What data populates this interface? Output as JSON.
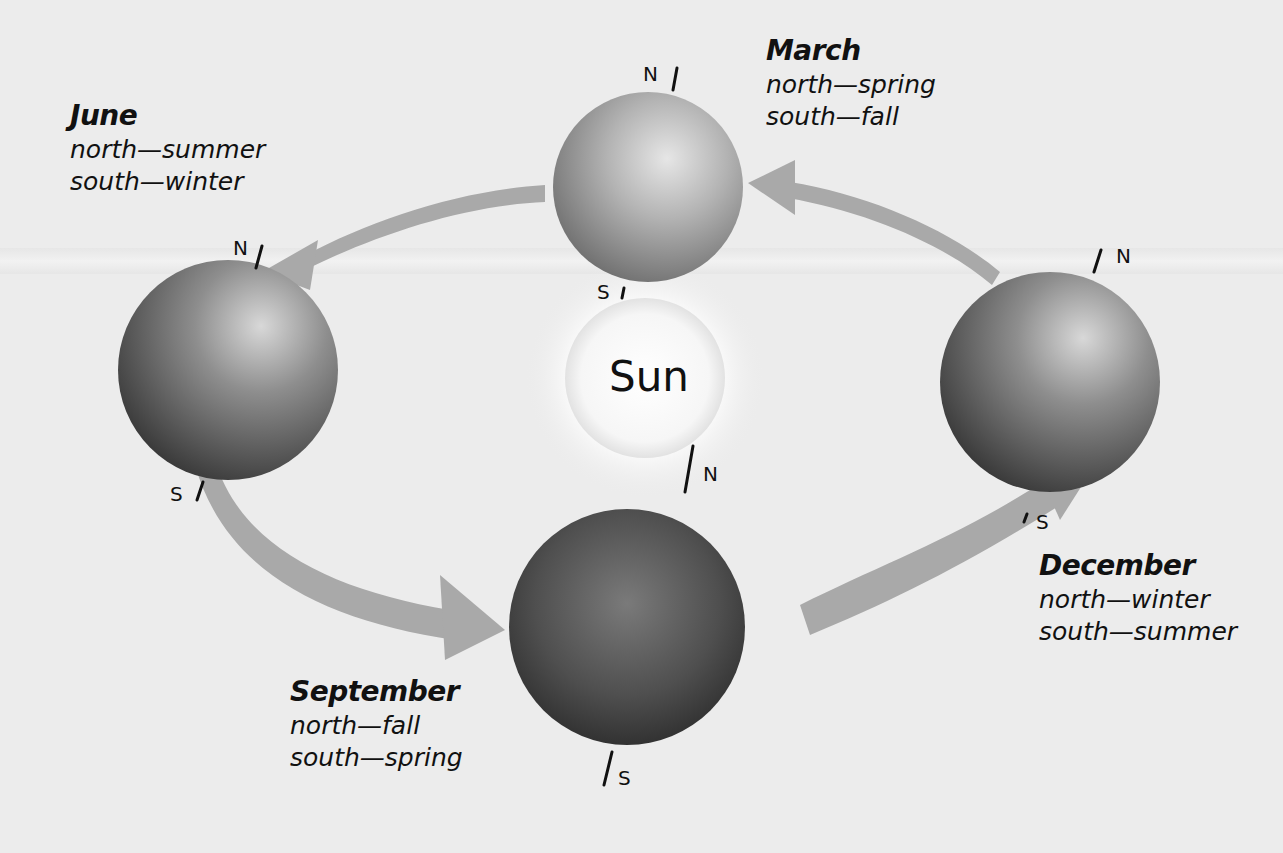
{
  "sun": {
    "label": "Sun"
  },
  "positions": [
    {
      "id": "june",
      "month": "June",
      "north": "north—summer",
      "south": "south—winter",
      "n_label": "N",
      "s_label": "S"
    },
    {
      "id": "march",
      "month": "March",
      "north": "north—spring",
      "south": "south—fall",
      "n_label": "N",
      "s_label": "S"
    },
    {
      "id": "december",
      "month": "December",
      "north": "north—winter",
      "south": "south—summer",
      "n_label": "N",
      "s_label": "S"
    },
    {
      "id": "september",
      "month": "September",
      "north": "north—fall",
      "south": "south—spring",
      "n_label": "N",
      "s_label": "S"
    }
  ],
  "colors": {
    "background": "#ececec",
    "arrow": "#a9a9a9",
    "text": "#111111"
  }
}
